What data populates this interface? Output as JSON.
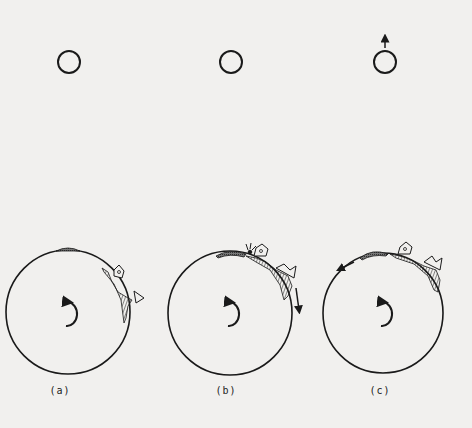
{
  "figure": {
    "background": "#f1f0ee",
    "ink": "#1a1a1a",
    "panels": [
      {
        "id": "a",
        "label": "(a)",
        "moon": {
          "cx": 69,
          "cy": 62,
          "r": 11,
          "arrow": false
        },
        "earth": {
          "cx": 68,
          "cy": 312,
          "r": 62
        },
        "label_x": 60,
        "description": "Moon aligned; tidal bulge on top; landscape on right limb"
      },
      {
        "id": "b",
        "label": "(b)",
        "moon": {
          "cx": 231,
          "cy": 62,
          "r": 11,
          "arrow": false
        },
        "earth": {
          "cx": 230,
          "cy": 313,
          "r": 62
        },
        "label_x": 226,
        "description": "Earth rotation carries bulge forward; downward arrow on right limb"
      },
      {
        "id": "c",
        "label": "(c)",
        "moon": {
          "cx": 385,
          "cy": 62,
          "r": 11,
          "arrow": true
        },
        "earth": {
          "cx": 383,
          "cy": 313,
          "r": 60
        },
        "label_x": 380,
        "description": "Moon pulled forward (upward arrow); arrow on left limb pointing backward"
      }
    ]
  }
}
